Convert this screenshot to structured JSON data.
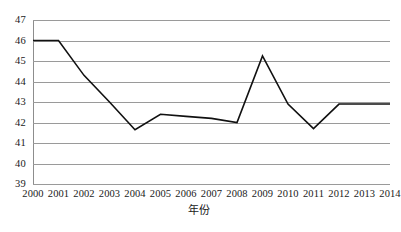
{
  "chart_data": {
    "type": "line",
    "title": "",
    "xlabel": "年份",
    "ylabel": "",
    "categories": [
      "2000",
      "2001",
      "2002",
      "2003",
      "2004",
      "2005",
      "2006",
      "2007",
      "2008",
      "2009",
      "2010",
      "2011",
      "2012",
      "2013",
      "2014"
    ],
    "values": [
      46.0,
      46.0,
      44.3,
      43.0,
      41.65,
      42.4,
      42.3,
      42.2,
      42.0,
      45.25,
      42.9,
      41.7,
      42.9,
      42.9,
      42.9
    ],
    "series": [
      {
        "name": "",
        "values": [
          46.0,
          46.0,
          44.3,
          43.0,
          41.65,
          42.4,
          42.3,
          42.2,
          42.0,
          45.25,
          42.9,
          41.7,
          42.9,
          42.9,
          42.9
        ]
      }
    ],
    "ylim": [
      39,
      47
    ],
    "xlim": [
      "2000",
      "2014"
    ],
    "y_ticks": [
      47,
      46,
      45,
      44,
      43,
      42,
      41,
      40,
      39
    ],
    "y_tick_labels": [
      "47",
      "46",
      "45",
      "44",
      "43",
      "42",
      "41",
      "40",
      "39"
    ],
    "x_tick_labels": [
      "2000",
      "2001",
      "2002",
      "2003",
      "2004",
      "2005",
      "2006",
      "2007",
      "2008",
      "2009",
      "2010",
      "2011",
      "2012",
      "2013",
      "2014"
    ],
    "grid": true,
    "grid_axis": "y",
    "legend": false,
    "legend_position": "none",
    "line_color": "#111111",
    "grid_color": "#9a9a9a",
    "axis_color": "#8d8d8d",
    "background_color": "#ffffff",
    "markers": false,
    "annotations": []
  },
  "figure": {
    "x_axis_title": "年份"
  }
}
